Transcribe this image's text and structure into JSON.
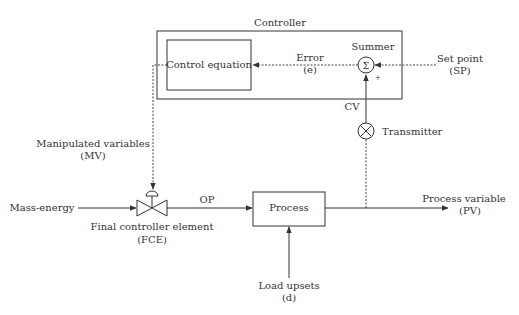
{
  "diagram": {
    "title": "Controller",
    "blocks": {
      "controller": {
        "label": "Controller"
      },
      "control_equation": {
        "label": "Control equation"
      },
      "summer": {
        "label": "Summer",
        "symbol": "Σ",
        "sign": "+"
      },
      "transmitter": {
        "label": "Transmitter"
      },
      "process": {
        "label": "Process"
      },
      "fce": {
        "label_line1": "Final controller element",
        "label_line2": "(FCE)"
      }
    },
    "signals": {
      "error": {
        "line1": "Error",
        "line2": "(e)"
      },
      "set_point": {
        "line1": "Set point",
        "line2": "(SP)"
      },
      "cv": {
        "label": "CV"
      },
      "mv": {
        "line1": "Manipulated variables",
        "line2": "(MV)"
      },
      "mass_energy": {
        "label": "Mass-energy"
      },
      "op": {
        "label": "OP"
      },
      "pv": {
        "line1": "Process variable",
        "line2": "(PV)"
      },
      "load": {
        "line1": "Load upsets",
        "line2": "(d)"
      }
    },
    "colors": {
      "line": "#333333",
      "text": "#333333",
      "background": "#ffffff"
    }
  }
}
